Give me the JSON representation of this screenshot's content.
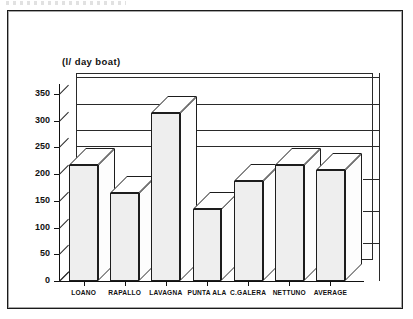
{
  "chart_data": {
    "type": "bar",
    "title": "(l/ day boat)",
    "xlabel": "",
    "ylabel": "",
    "categories": [
      "LOANO",
      "RAPALLO",
      "LAVAGNA",
      "PUNTA ALA",
      "C.GALERA",
      "NETTUNO",
      "AVERAGE"
    ],
    "values": [
      218,
      165,
      315,
      135,
      188,
      218,
      208
    ],
    "ylim": [
      0,
      350
    ],
    "yticks": [
      0,
      50,
      100,
      150,
      200,
      250,
      300,
      350
    ],
    "ytick_labels": [
      "0",
      "50",
      "100",
      "150",
      "200",
      "250",
      "300",
      "350"
    ],
    "grid": true,
    "gridline_values": [
      350,
      300,
      250,
      220
    ],
    "legend": null,
    "style": "3d-bar",
    "colors": {
      "bar_face": "#eeeeee",
      "bar_top": "#ffffff",
      "bar_side": "#fdfdfd",
      "outline": "#1d1d1d",
      "axis": "#111111",
      "background": "#ffffff"
    }
  }
}
